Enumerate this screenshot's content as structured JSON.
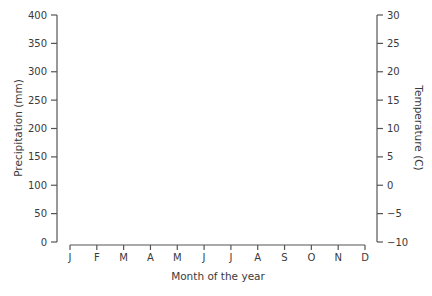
{
  "chart_data": {
    "type": "line",
    "title": "",
    "xlabel": "Month of the year",
    "ylabel": "Precipitation (mm)",
    "y2label": "Temperature (C)",
    "categories": [
      "J",
      "F",
      "M",
      "A",
      "M",
      "J",
      "J",
      "A",
      "S",
      "O",
      "N",
      "D"
    ],
    "y_ticks": [
      0,
      50,
      100,
      150,
      200,
      250,
      300,
      350,
      400
    ],
    "y_tick_labels": [
      "0",
      "50",
      "100",
      "150",
      "200",
      "250",
      "300",
      "350",
      "400"
    ],
    "y2_ticks": [
      -10,
      -5,
      0,
      5,
      10,
      15,
      20,
      25,
      30
    ],
    "y2_tick_labels": [
      "−10",
      "−5",
      "0",
      "5",
      "10",
      "15",
      "20",
      "25",
      "30"
    ],
    "ylim": [
      0,
      400
    ],
    "y2lim": [
      -10,
      30
    ],
    "grid": false,
    "legend": null,
    "series": []
  },
  "colors": {
    "axis": "#555555",
    "text": "#3a3a3a",
    "background": "#ffffff"
  }
}
